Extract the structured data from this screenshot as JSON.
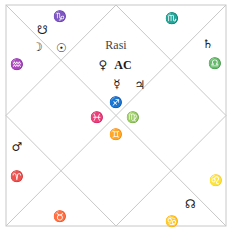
{
  "chart": {
    "title": "Rasi",
    "style": "North Indian diamond chart",
    "line_color": "#c8c8c8",
    "frame": {
      "x": 6,
      "y": 5,
      "w": 220,
      "h": 221
    }
  },
  "labels": [
    {
      "id": "rasi-title",
      "text": "Rasi",
      "x": 116,
      "y": 45,
      "kind": "title"
    },
    {
      "id": "venus",
      "text": "♀",
      "x": 103,
      "y": 65,
      "kind": "planet"
    },
    {
      "id": "ascendant",
      "text": "AC",
      "x": 123,
      "y": 65,
      "kind": "asc"
    },
    {
      "id": "mercury",
      "text": "☿",
      "x": 117,
      "y": 84,
      "kind": "planet"
    },
    {
      "id": "jupiter",
      "text": "♃",
      "x": 140,
      "y": 85,
      "kind": "planet"
    },
    {
      "id": "sagittarius",
      "text": "♐",
      "x": 116,
      "y": 103,
      "kind": "sign"
    },
    {
      "id": "pisces",
      "text": "♓",
      "x": 97,
      "y": 118,
      "kind": "sign"
    },
    {
      "id": "virgo",
      "text": "♍",
      "x": 133,
      "y": 118,
      "kind": "sign"
    },
    {
      "id": "gemini",
      "text": "♊",
      "x": 116,
      "y": 135,
      "kind": "sign"
    },
    {
      "id": "capricorn",
      "text": "♑",
      "x": 60,
      "y": 17,
      "kind": "sign"
    },
    {
      "id": "ketu",
      "text": "☋",
      "x": 42,
      "y": 30,
      "kind": "planet"
    },
    {
      "id": "moon",
      "text": "☽",
      "x": 37,
      "y": 47,
      "kind": "planet"
    },
    {
      "id": "sun",
      "text": "☉",
      "x": 61,
      "y": 48,
      "kind": "planet"
    },
    {
      "id": "aquarius",
      "text": "♒",
      "x": 17,
      "y": 65,
      "kind": "sign"
    },
    {
      "id": "scorpio",
      "text": "♏",
      "x": 172,
      "y": 19,
      "kind": "sign"
    },
    {
      "id": "saturn",
      "text": "♄",
      "x": 208,
      "y": 44,
      "kind": "planet"
    },
    {
      "id": "libra",
      "text": "♎",
      "x": 215,
      "y": 64,
      "kind": "sign"
    },
    {
      "id": "mars",
      "text": "♂",
      "x": 17,
      "y": 147,
      "kind": "planet"
    },
    {
      "id": "aries",
      "text": "♈",
      "x": 17,
      "y": 177,
      "kind": "sign"
    },
    {
      "id": "taurus",
      "text": "♉",
      "x": 60,
      "y": 217,
      "kind": "sign"
    },
    {
      "id": "leo",
      "text": "♌",
      "x": 216,
      "y": 181,
      "kind": "sign"
    },
    {
      "id": "rahu",
      "text": "☊",
      "x": 190,
      "y": 204,
      "kind": "planet"
    },
    {
      "id": "cancer",
      "text": "♋",
      "x": 172,
      "y": 222,
      "kind": "sign"
    }
  ]
}
